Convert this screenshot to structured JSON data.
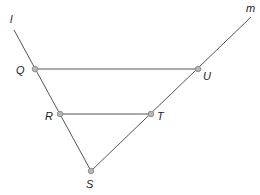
{
  "diagram": {
    "type": "geometry",
    "lines": [
      {
        "name": "l",
        "label": "l",
        "from": [
          14,
          30
        ],
        "to": [
          91,
          171
        ],
        "label_pos": [
          10,
          23
        ]
      },
      {
        "name": "m",
        "label": "m",
        "from": [
          251,
          17
        ],
        "to": [
          91,
          171
        ],
        "label_pos": [
          246,
          12
        ]
      }
    ],
    "segments": [
      {
        "name": "QU",
        "from": "Q",
        "to": "U"
      },
      {
        "name": "RT",
        "from": "R",
        "to": "T"
      }
    ],
    "points": [
      {
        "name": "Q",
        "label": "Q",
        "pos": [
          35,
          69
        ],
        "label_pos": [
          16,
          74
        ]
      },
      {
        "name": "U",
        "label": "U",
        "pos": [
          198,
          69
        ],
        "label_pos": [
          203,
          80
        ]
      },
      {
        "name": "R",
        "label": "R",
        "pos": [
          60,
          114
        ],
        "label_pos": [
          45,
          120
        ]
      },
      {
        "name": "T",
        "label": "T",
        "pos": [
          151,
          114
        ],
        "label_pos": [
          157,
          120
        ]
      },
      {
        "name": "S",
        "label": "S",
        "pos": [
          91,
          171
        ],
        "label_pos": [
          86,
          188
        ]
      }
    ],
    "colors": {
      "line": "#555555",
      "point_fill": "#b8b8b8",
      "point_stroke": "#808080",
      "text": "#222222"
    }
  }
}
